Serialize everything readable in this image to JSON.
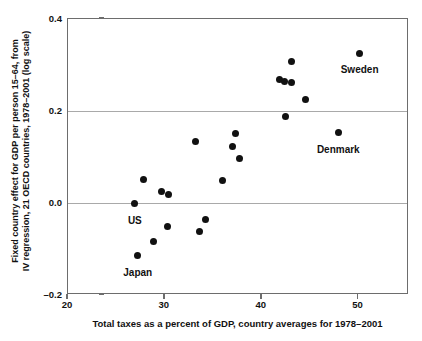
{
  "chart_data": {
    "type": "scatter",
    "title": "",
    "xlabel": "Total taxes as a percent of GDP, country averages for 1978–2001",
    "ylabel_line1": "Fixed country effect for GDP per person 15–64, from",
    "ylabel_line2": "IV regression, 21 OECD countries, 1978–2001 (log scale)",
    "xlim": [
      20,
      55.2
    ],
    "ylim": [
      -0.2,
      0.4
    ],
    "xticks": [
      20,
      30,
      40,
      50
    ],
    "xtick_labels": [
      "20",
      "30",
      "40",
      "50"
    ],
    "yticks": [
      -0.2,
      0.0,
      0.2,
      0.4
    ],
    "ytick_labels": [
      "–0.2",
      "0.0",
      "0.2",
      "0.4"
    ],
    "gridlines_y": [
      0.0,
      0.2
    ],
    "grid": "horizontal-only",
    "legend": "none",
    "marker_color": "#111111",
    "points": [
      {
        "x": 50.1,
        "y": 0.326,
        "label": "Sweden",
        "label_dx": 0,
        "label_dy": 11
      },
      {
        "x": 43.1,
        "y": 0.307,
        "label": "",
        "label_dx": 0,
        "label_dy": 0
      },
      {
        "x": 41.8,
        "y": 0.268,
        "label": "",
        "label_dx": 0,
        "label_dy": 0
      },
      {
        "x": 42.3,
        "y": 0.264,
        "label": "",
        "label_dx": 0,
        "label_dy": 0
      },
      {
        "x": 43.1,
        "y": 0.263,
        "label": "",
        "label_dx": 0,
        "label_dy": 0
      },
      {
        "x": 44.5,
        "y": 0.226,
        "label": "",
        "label_dx": 0,
        "label_dy": 0
      },
      {
        "x": 42.5,
        "y": 0.187,
        "label": "",
        "label_dx": 0,
        "label_dy": 0
      },
      {
        "x": 47.9,
        "y": 0.153,
        "label": "Denmark",
        "label_dx": 0,
        "label_dy": 11
      },
      {
        "x": 37.3,
        "y": 0.152,
        "label": "",
        "label_dx": 0,
        "label_dy": 0
      },
      {
        "x": 33.2,
        "y": 0.133,
        "label": "",
        "label_dx": 0,
        "label_dy": 0
      },
      {
        "x": 37.0,
        "y": 0.122,
        "label": "",
        "label_dx": 0,
        "label_dy": 0
      },
      {
        "x": 37.7,
        "y": 0.096,
        "label": "",
        "label_dx": 0,
        "label_dy": 0
      },
      {
        "x": 27.8,
        "y": 0.052,
        "label": "",
        "label_dx": 0,
        "label_dy": 0
      },
      {
        "x": 35.9,
        "y": 0.048,
        "label": "",
        "label_dx": 0,
        "label_dy": 0
      },
      {
        "x": 29.7,
        "y": 0.026,
        "label": "",
        "label_dx": 0,
        "label_dy": 0
      },
      {
        "x": 30.4,
        "y": 0.019,
        "label": "",
        "label_dx": 0,
        "label_dy": 0
      },
      {
        "x": 26.9,
        "y": 0.0,
        "label": "US",
        "label_dx": 0,
        "label_dy": 12
      },
      {
        "x": 34.2,
        "y": -0.035,
        "label": "",
        "label_dx": 0,
        "label_dy": 0
      },
      {
        "x": 30.3,
        "y": -0.052,
        "label": "",
        "label_dx": 0,
        "label_dy": 0
      },
      {
        "x": 33.6,
        "y": -0.063,
        "label": "",
        "label_dx": 0,
        "label_dy": 0
      },
      {
        "x": 28.8,
        "y": -0.084,
        "label": "",
        "label_dx": 0,
        "label_dy": 0
      },
      {
        "x": 27.2,
        "y": -0.114,
        "label": "Japan",
        "label_dx": 0,
        "label_dy": 12
      }
    ]
  }
}
